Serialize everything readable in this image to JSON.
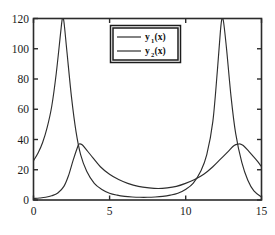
{
  "chart_data": {
    "type": "line",
    "title": "",
    "xlabel": "",
    "ylabel": "",
    "xlim": [
      0,
      15
    ],
    "ylim": [
      0,
      120
    ],
    "xticks": [
      0,
      5,
      10,
      15
    ],
    "xtick_labels": [
      "0",
      "5",
      "10",
      "15"
    ],
    "yticks": [
      0,
      20,
      40,
      60,
      80,
      100,
      120
    ],
    "ytick_labels": [
      "0",
      "20",
      "40",
      "60",
      "80",
      "100",
      "120"
    ],
    "grid": false,
    "legend_position": "upper center",
    "series": [
      {
        "name": "y_1(x)",
        "legend_label": "y₁(x)",
        "color": "#2e2e2e",
        "peaks": [
          {
            "x": 1.9,
            "y": 120
          },
          {
            "x": 12.4,
            "y": 120
          }
        ],
        "value_at_x0": 26,
        "value_at_x15": 2,
        "x": [
          0.0,
          0.3,
          0.6,
          0.9,
          1.2,
          1.5,
          1.8,
          1.9,
          2.0,
          2.2,
          2.5,
          2.8,
          3.1,
          3.5,
          4.0,
          4.5,
          5.0,
          5.5,
          6.0,
          6.5,
          7.0,
          7.5,
          8.0,
          8.5,
          9.0,
          9.5,
          10.0,
          10.5,
          11.0,
          11.4,
          11.8,
          12.1,
          12.3,
          12.4,
          12.5,
          12.7,
          13.0,
          13.3,
          13.7,
          14.1,
          14.5,
          15.0
        ],
        "y": [
          26,
          31,
          38,
          48,
          62,
          84,
          112,
          120,
          118,
          98,
          68,
          45,
          30,
          19,
          11,
          7,
          4.5,
          3.2,
          2.4,
          2.0,
          1.8,
          1.8,
          2.0,
          2.4,
          3.2,
          4.5,
          7,
          11,
          19,
          30,
          52,
          86,
          112,
          120,
          118,
          100,
          68,
          44,
          25,
          13,
          6,
          2
        ]
      },
      {
        "name": "y_2(x)",
        "legend_label": "y₂(x)",
        "color": "#2e2e2e",
        "peaks": [
          {
            "x": 3.0,
            "y": 37
          },
          {
            "x": 13.6,
            "y": 37
          }
        ],
        "value_at_x0": 1,
        "value_at_x15": 22,
        "x": [
          0.0,
          0.4,
          0.8,
          1.2,
          1.6,
          2.0,
          2.3,
          2.6,
          2.9,
          3.0,
          3.2,
          3.5,
          3.9,
          4.4,
          5.0,
          5.6,
          6.2,
          6.9,
          7.6,
          8.2,
          8.8,
          9.4,
          10.0,
          10.6,
          11.2,
          11.8,
          12.3,
          12.8,
          13.2,
          13.5,
          13.6,
          13.8,
          14.1,
          14.4,
          14.7,
          15.0
        ],
        "y": [
          1,
          1.3,
          1.8,
          2.8,
          4.6,
          9,
          16,
          26,
          35,
          37,
          36.5,
          33,
          28,
          22,
          17,
          13.5,
          11,
          9,
          8,
          7.6,
          8,
          9,
          11,
          13.5,
          17,
          22,
          27,
          32,
          36,
          37,
          37,
          36,
          33,
          29.5,
          26,
          22
        ]
      }
    ],
    "annotations": []
  },
  "legend": {
    "entries": [
      {
        "base": "y",
        "sub": "1",
        "suffix": "(x)"
      },
      {
        "base": "y",
        "sub": "2",
        "suffix": "(x)"
      }
    ]
  },
  "colors": {
    "curve": "#2e2e2e",
    "axis": "#2b2b2b",
    "background": "#ffffff",
    "text": "#1a1a1a"
  }
}
